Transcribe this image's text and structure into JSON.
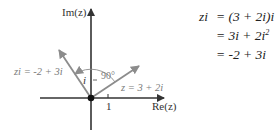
{
  "diagram": {
    "axes": {
      "imag_label": "Im(z)",
      "real_label": "Re(z)",
      "tick_label": "1"
    },
    "vectors": [
      {
        "name": "z",
        "label": "z = 3 + 2i",
        "x": 3,
        "y": 2
      },
      {
        "name": "zi",
        "label": "zi = -2 + 3i",
        "x": -2,
        "y": 3
      }
    ],
    "angle_label": "90°",
    "rotation_label": "i",
    "colors": {
      "axes": "#333333",
      "vectors": "#8c8c8c",
      "labels": "#7a7a7a",
      "origin": "#111111"
    }
  },
  "equations": {
    "line1_lhs": "zi",
    "line1_rhs": "= (3 + 2i)i",
    "line2": "= 3i + 2i",
    "line2_exp": "2",
    "line3": "= -2 + 3i"
  }
}
